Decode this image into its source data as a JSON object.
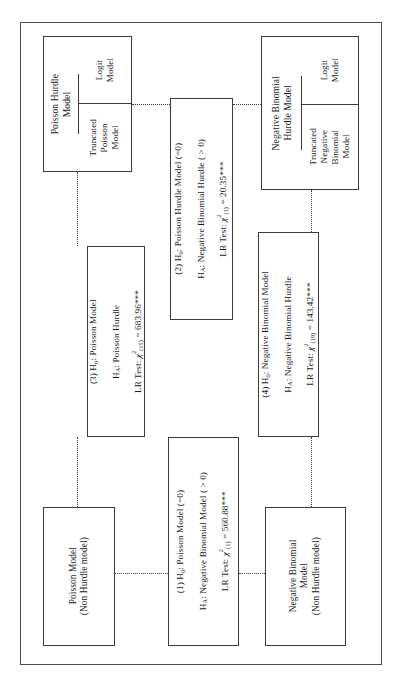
{
  "figure": {
    "type": "flowchart",
    "orientation": "rotated-90-ccw",
    "accent_color": "#3b3b3b",
    "frame_color": "#4d4d4d",
    "background": "#ffffff"
  },
  "nodes": {
    "poisson_hurdle": {
      "title": "Poisson Hurdle\nModel",
      "sub_top": "Logit\nModel",
      "sub_bottom": "Truncated\nPoisson\nModel"
    },
    "negbin_hurdle": {
      "title": "Negative Binomial\nHurdle Model",
      "sub_top": "Logit\nModel",
      "sub_bottom": "Truncated\nNegative\nBinomial\nModel"
    },
    "poisson_plain": {
      "label": "Poisson Model\n(Non Hurdle model)"
    },
    "negbin_plain": {
      "label": "Negative Binomial\nModel\n(Non Hurdle model)"
    }
  },
  "tests": {
    "test1": {
      "number": "(1)",
      "h0": "H",
      "h0_sub": "0",
      "h0_text": ": Poisson Model (=0)",
      "ha": "H",
      "ha_sub": "A",
      "ha_text": ": Negative Binomial Model ( > 0)",
      "stat_prefix": "LR Test: ",
      "chi": "χ",
      "chi_sup": "2",
      "chi_sub": "(1)",
      "equals": " = ",
      "value": "560.88***"
    },
    "test2": {
      "number": "(2)",
      "h0": "H",
      "h0_sub": "0",
      "h0_text": ": Poisson Hurdle Model (=0)",
      "ha": "H",
      "ha_sub": "A",
      "ha_text": ": Negative Binomial Hurdle ( > 0)",
      "stat_prefix": "LR Test: ",
      "chi": "χ",
      "chi_sup": "2",
      "chi_sub": "(1)",
      "equals": " = ",
      "value": "20.35***"
    },
    "test3": {
      "number": "(3)",
      "h0": "H",
      "h0_sub": "0",
      "h0_text": ": Poisson Model",
      "ha": "H",
      "ha_sub": "A",
      "ha_text": ": Poisson Hurdle",
      "stat_prefix": "LR Test: ",
      "chi": "χ",
      "chi_sup": "2",
      "chi_sub": "(15)",
      "equals": " = ",
      "value": "683.96***"
    },
    "test4": {
      "number": "(4)",
      "h0": "H",
      "h0_sub": "0",
      "h0_text": ": Negative Binomial Model",
      "ha": "H",
      "ha_sub": "A",
      "ha_text": ": Negative Binomial Hurdle",
      "stat_prefix": "LR Test: ",
      "chi": "χ",
      "chi_sup": "2",
      "chi_sub": "(19)",
      "equals": "  = ",
      "value": "143.42***"
    }
  }
}
